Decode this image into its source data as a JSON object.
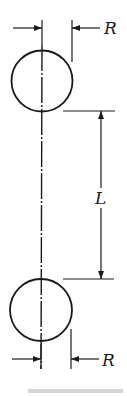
{
  "figure": {
    "dimensions": {
      "top_radius_label": "R",
      "bottom_radius_label": "R",
      "separation_label": "L"
    },
    "caption_partial": ""
  }
}
